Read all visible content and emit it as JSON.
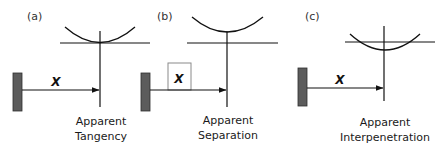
{
  "figure": {
    "colors": {
      "line": "#111111",
      "bar_fill": "#5c5c5c",
      "bar_stroke": "#2e2e2e",
      "box_stroke": "#8a8a8a",
      "text": "#1a1a1a"
    },
    "panels": [
      {
        "id": "a",
        "label": "(a)",
        "displacement_label": "X",
        "caption_line1": "Apparent",
        "caption_line2": "Tangency",
        "relation": "curve touches horizontal line at its minimum"
      },
      {
        "id": "b",
        "label": "(b)",
        "displacement_label": "X",
        "caption_line1": "Apparent",
        "caption_line2": "Separation",
        "relation": "curve lies above horizontal line (gap)"
      },
      {
        "id": "c",
        "label": "(c)",
        "displacement_label": "X",
        "caption_line1": "Apparent",
        "caption_line2": "Interpenetration",
        "relation": "curve dips below horizontal line (overlap)"
      }
    ]
  }
}
